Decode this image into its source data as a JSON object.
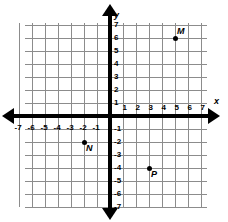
{
  "chart_data": {
    "type": "scatter",
    "title": "",
    "xlabel": "x",
    "ylabel": "y",
    "xlim": [
      -7,
      7
    ],
    "ylim": [
      -7,
      7
    ],
    "grid": true,
    "legend": "none",
    "x_ticks": [
      -7,
      -6,
      -5,
      -4,
      -3,
      -2,
      -1,
      1,
      2,
      3,
      4,
      5,
      6,
      7
    ],
    "y_ticks": [
      7,
      6,
      5,
      4,
      3,
      2,
      1,
      -1,
      -2,
      -3,
      -4,
      -5,
      -6,
      -7
    ],
    "x_tick_labels": [
      "-7",
      "-6",
      "-5",
      "-4",
      "-3",
      "-2",
      "-1",
      "1",
      "2",
      "3",
      "4",
      "5",
      "6",
      "7"
    ],
    "y_tick_labels": [
      "7",
      "6",
      "5",
      "4",
      "3",
      "2",
      "1",
      "-1",
      "-2",
      "-3",
      "-4",
      "-5",
      "-6",
      "-7"
    ],
    "points": [
      {
        "label": "M",
        "x": 5,
        "y": 6
      },
      {
        "label": "N",
        "x": -2,
        "y": -2
      },
      {
        "label": "P",
        "x": 3,
        "y": -4
      }
    ]
  },
  "colors": {
    "grid": "#8c8c8c",
    "axis": "#000000",
    "point": "#000000",
    "background": "#ffffff"
  }
}
